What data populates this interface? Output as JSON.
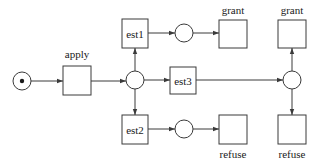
{
  "diagram": {
    "type": "petri-net",
    "colors": {
      "stroke": "#3a3a3a",
      "text": "#1a1a1a",
      "background": "#ffffff"
    },
    "places": [
      {
        "id": "p_start",
        "cx": 22,
        "cy": 81,
        "r": 9,
        "tokens": 1
      },
      {
        "id": "p_mid",
        "cx": 135,
        "cy": 80,
        "r": 9,
        "tokens": 0
      },
      {
        "id": "p_top",
        "cx": 184,
        "cy": 33,
        "r": 9,
        "tokens": 0
      },
      {
        "id": "p_bottom",
        "cx": 184,
        "cy": 129,
        "r": 9,
        "tokens": 0
      },
      {
        "id": "p_right",
        "cx": 292,
        "cy": 80,
        "r": 9,
        "tokens": 0
      }
    ],
    "transitions": [
      {
        "id": "t_apply",
        "x": 63,
        "y": 66,
        "w": 28,
        "h": 29,
        "inner_label": "",
        "label": "apply",
        "label_x": 77,
        "label_y": 58
      },
      {
        "id": "t_est1",
        "x": 122,
        "y": 19,
        "w": 26,
        "h": 29,
        "inner_label": "est1",
        "label": "",
        "label_x": 0,
        "label_y": 0
      },
      {
        "id": "t_est2",
        "x": 122,
        "y": 115,
        "w": 26,
        "h": 29,
        "inner_label": "est2",
        "label": "",
        "label_x": 0,
        "label_y": 0
      },
      {
        "id": "t_est3",
        "x": 170,
        "y": 67,
        "w": 26,
        "h": 27,
        "inner_label": "est3",
        "label": "",
        "label_x": 0,
        "label_y": 0
      },
      {
        "id": "t_grant1",
        "x": 219,
        "y": 20,
        "w": 28,
        "h": 28,
        "inner_label": "",
        "label": "grant",
        "label_x": 233,
        "label_y": 14
      },
      {
        "id": "t_refuse1",
        "x": 219,
        "y": 115,
        "w": 28,
        "h": 29,
        "inner_label": "",
        "label": "refuse",
        "label_x": 233,
        "label_y": 158
      },
      {
        "id": "t_grant2",
        "x": 278,
        "y": 20,
        "w": 28,
        "h": 28,
        "inner_label": "",
        "label": "grant",
        "label_x": 292,
        "label_y": 14
      },
      {
        "id": "t_refuse2",
        "x": 278,
        "y": 115,
        "w": 28,
        "h": 29,
        "inner_label": "",
        "label": "refuse",
        "label_x": 292,
        "label_y": 158
      }
    ],
    "arcs": [
      {
        "from": "p_start",
        "to": "t_apply",
        "x1": 31,
        "y1": 81,
        "x2": 63,
        "y2": 81
      },
      {
        "from": "t_apply",
        "to": "p_mid",
        "x1": 91,
        "y1": 81,
        "x2": 126,
        "y2": 81
      },
      {
        "from": "p_mid",
        "to": "t_est1",
        "x1": 135,
        "y1": 71,
        "x2": 135,
        "y2": 48
      },
      {
        "from": "p_mid",
        "to": "t_est2",
        "x1": 135,
        "y1": 89,
        "x2": 135,
        "y2": 115
      },
      {
        "from": "p_mid",
        "to": "t_est3",
        "x1": 144,
        "y1": 80,
        "x2": 170,
        "y2": 80
      },
      {
        "from": "t_est1",
        "to": "p_top",
        "x1": 148,
        "y1": 33,
        "x2": 175,
        "y2": 33
      },
      {
        "from": "p_top",
        "to": "t_grant1",
        "x1": 193,
        "y1": 33,
        "x2": 219,
        "y2": 33
      },
      {
        "from": "t_est2",
        "to": "p_bottom",
        "x1": 148,
        "y1": 129,
        "x2": 175,
        "y2": 129
      },
      {
        "from": "p_bottom",
        "to": "t_refuse1",
        "x1": 193,
        "y1": 129,
        "x2": 219,
        "y2": 129
      },
      {
        "from": "t_est3",
        "to": "p_right",
        "x1": 196,
        "y1": 80,
        "x2": 283,
        "y2": 80
      },
      {
        "from": "p_right",
        "to": "t_grant2",
        "x1": 292,
        "y1": 71,
        "x2": 292,
        "y2": 48
      },
      {
        "from": "p_right",
        "to": "t_refuse2",
        "x1": 292,
        "y1": 89,
        "x2": 292,
        "y2": 115
      }
    ]
  }
}
